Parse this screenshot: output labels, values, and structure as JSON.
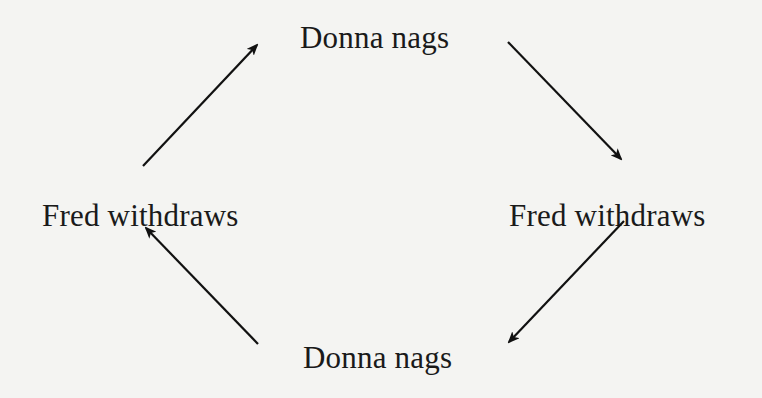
{
  "diagram": {
    "type": "cycle",
    "nodes": [
      {
        "id": "top",
        "label": "Donna nags"
      },
      {
        "id": "right",
        "label": "Fred withdraws"
      },
      {
        "id": "bottom",
        "label": "Donna nags"
      },
      {
        "id": "left",
        "label": "Fred withdraws"
      }
    ],
    "edges": [
      {
        "from": "left",
        "to": "top"
      },
      {
        "from": "top",
        "to": "right"
      },
      {
        "from": "right",
        "to": "bottom"
      },
      {
        "from": "bottom",
        "to": "left"
      }
    ],
    "colors": {
      "background": "#f4f4f2",
      "text": "#1a1a1a",
      "arrow": "#111111"
    }
  }
}
